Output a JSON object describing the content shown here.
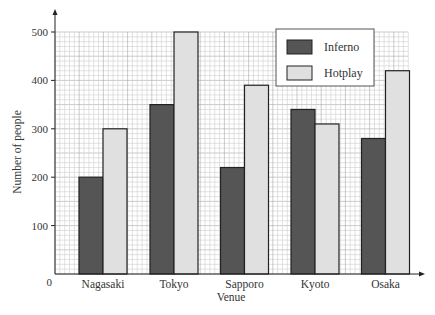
{
  "chart_data": {
    "type": "bar",
    "title": "",
    "xlabel": "Venue",
    "ylabel": "Number of people",
    "categories": [
      "Nagasaki",
      "Tokyo",
      "Sapporo",
      "Kyoto",
      "Osaka"
    ],
    "series": [
      {
        "name": "Inferno",
        "color": "#555555",
        "values": [
          200,
          350,
          220,
          340,
          280
        ]
      },
      {
        "name": "Hotplay",
        "color": "#e0e0e0",
        "values": [
          300,
          500,
          390,
          310,
          420
        ]
      }
    ],
    "ylim": [
      0,
      500
    ],
    "yticks": [
      0,
      100,
      200,
      300,
      400,
      500
    ],
    "ytick_labels": [
      "0",
      "100",
      "200",
      "300",
      "400",
      "500"
    ],
    "grid": true,
    "legend_position": "upper right"
  },
  "colors": {
    "inferno": "#555555",
    "hotplay": "#e0e0e0",
    "bar_border": "#222222",
    "grid_minor": "#cfcfcf",
    "grid_major": "#a8a8a8",
    "axis": "#222222",
    "text": "#333333"
  }
}
